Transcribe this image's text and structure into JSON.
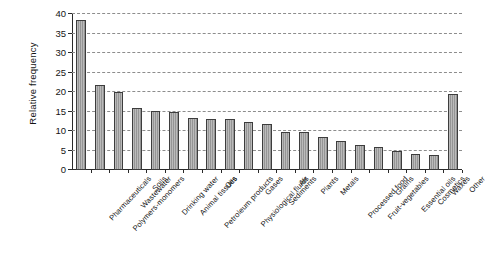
{
  "chart_data": {
    "type": "bar",
    "title": "",
    "xlabel": "",
    "ylabel": "Relative frequency",
    "ylim": [
      0,
      40
    ],
    "yticks": [
      0,
      5,
      10,
      15,
      20,
      25,
      30,
      35,
      40
    ],
    "ytick_labels": [
      "0",
      "5",
      "10",
      "15",
      "20",
      "25",
      "30",
      "35",
      "40"
    ],
    "grid": true,
    "legend": "none",
    "bar_color": "#9d9d9d",
    "bar_edge_color": "#3d3d3d",
    "categories": [
      "Pharmaceuticals",
      "Polymers-monomers",
      "Wastewater",
      "Soils",
      "Drinking water",
      "Animal tissues",
      "Petroleum products",
      "Oils",
      "Physiological fluids",
      "Gases",
      "Sediments",
      "Air",
      "Plants",
      "Metals",
      "Processed food",
      "Fruit-vegetables",
      "Grains",
      "Essential oils",
      "Cosmetics",
      "Waxes",
      "Other"
    ],
    "values": [
      38.5,
      21.8,
      20.0,
      16.0,
      15.2,
      14.8,
      13.4,
      13.1,
      13.1,
      12.3,
      11.7,
      9.8,
      9.8,
      8.5,
      7.5,
      6.3,
      6.0,
      4.9,
      4.0,
      3.8,
      19.6
    ]
  }
}
